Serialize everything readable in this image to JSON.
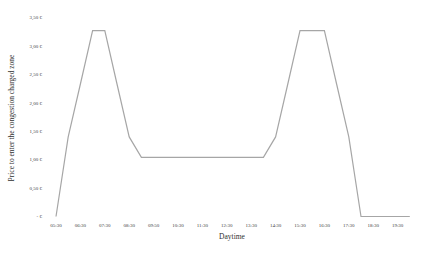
{
  "chart_data": {
    "type": "line",
    "title": "",
    "xlabel": "Daytime",
    "ylabel": "Price to enter the congestion charged zone",
    "x_tick_labels": [
      "05:30",
      "06:30",
      "07:30",
      "08:30",
      "09:50",
      "10:30",
      "11:30",
      "12:30",
      "13:30",
      "14:30",
      "15:30",
      "16:30",
      "17:30",
      "18:30",
      "19:30"
    ],
    "y_tick_labels": [
      "- €",
      "0,50 €",
      "1,00 €",
      "1,50 €",
      "2,00 €",
      "2,50 €",
      "3,00 €",
      "3,50 €"
    ],
    "ylim": [
      0,
      3.5
    ],
    "grid": false,
    "legend": "none",
    "x": [
      "05:30",
      "06:00",
      "06:30",
      "07:00",
      "07:30",
      "08:00",
      "08:30",
      "09:00",
      "09:30",
      "10:00",
      "10:30",
      "11:00",
      "11:30",
      "12:00",
      "12:30",
      "13:00",
      "13:30",
      "14:00",
      "14:30",
      "15:00",
      "15:30",
      "16:00",
      "16:30",
      "17:00",
      "17:30",
      "18:00",
      "18:30",
      "19:00",
      "19:30",
      "20:00"
    ],
    "series": [
      {
        "name": "Price",
        "color": "#a6a6a6",
        "values": [
          0,
          1.4,
          2.33,
          3.27,
          3.27,
          2.33,
          1.4,
          1.04,
          1.04,
          1.04,
          1.04,
          1.04,
          1.04,
          1.04,
          1.04,
          1.04,
          1.04,
          1.04,
          1.4,
          2.33,
          3.27,
          3.27,
          3.27,
          2.33,
          1.4,
          0,
          0,
          0,
          0,
          0
        ]
      }
    ]
  }
}
